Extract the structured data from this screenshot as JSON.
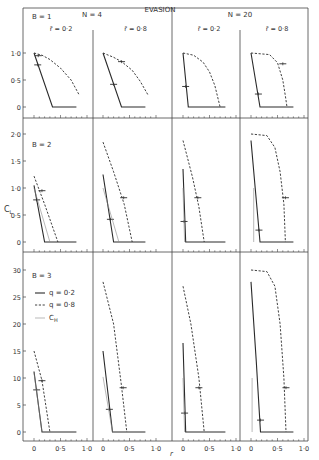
{
  "title": "EVASION",
  "group_labels": [
    {
      "text": "N = 4",
      "x": 92,
      "y": 17
    },
    {
      "text": "N = 20",
      "x": 240,
      "y": 17
    }
  ],
  "column_labels": [
    {
      "text": "r̄ = 0·2",
      "col": 0
    },
    {
      "text": "r̄ = 0·8",
      "col": 1
    },
    {
      "text": "r̄ = 0·2",
      "col": 2
    },
    {
      "text": "r̄ = 0·8",
      "col": 3
    }
  ],
  "row_labels": [
    "B = 1",
    "B = 2",
    "B = 3"
  ],
  "ylabel": "C_L",
  "xlabel": "r",
  "legend": [
    {
      "label": "q = 0·2",
      "style": "solid"
    },
    {
      "label": "q = 0·8",
      "style": "dashed"
    },
    {
      "label": "C_H",
      "style": "thin"
    }
  ],
  "chart_data": {
    "type": "line",
    "title": "EVASION",
    "xlabel": "r",
    "ylabel": "C_L",
    "layout": "small multiples: 3 rows (B = 1, 2, 3) x 4 columns (N = 4: r̄ = 0.2, 0.8; N = 20: r̄ = 0.2, 0.8)",
    "x_ticks": [
      "0",
      "0·5",
      "1·0"
    ],
    "xlim": [
      0,
      1.0
    ],
    "rows": [
      {
        "B": 1,
        "ylim": [
          0,
          1.0
        ],
        "y_ticks": [
          "0",
          "0·5",
          "1·0"
        ]
      },
      {
        "B": 2,
        "ylim": [
          0,
          2.0
        ],
        "y_ticks": [
          "0",
          "0·5",
          "1·0",
          "1·5",
          "2·0"
        ]
      },
      {
        "B": 3,
        "ylim": [
          0,
          3.0
        ],
        "y_ticks": [
          "0",
          "5",
          "10",
          "15",
          "20",
          "25",
          "30"
        ],
        "note": "tick labels read 5..30 meaning 0.5..3.0"
      }
    ],
    "legend": [
      "q = 0·2 (solid)",
      "q = 0·8 (dashed)",
      "C_H (thin solid)"
    ],
    "panels": [
      {
        "B": 1,
        "N": 4,
        "rbar": 0.2,
        "series": [
          {
            "name": "q = 0·2",
            "x": [
              0,
              0.35,
              0.8
            ],
            "y": [
              1.0,
              0,
              0
            ],
            "marker": [
              0.07,
              0.78
            ]
          },
          {
            "name": "q = 0·8",
            "x": [
              0,
              0.15,
              0.3,
              0.5,
              0.7,
              0.85
            ],
            "y": [
              1.0,
              0.96,
              0.88,
              0.72,
              0.5,
              0.23
            ],
            "marker": [
              0.08,
              0.95
            ]
          }
        ]
      },
      {
        "B": 1,
        "N": 4,
        "rbar": 0.8,
        "series": [
          {
            "name": "q = 0·2",
            "x": [
              0,
              0.35,
              0.8
            ],
            "y": [
              1.0,
              0,
              0
            ],
            "marker": [
              0.2,
              0.42
            ]
          },
          {
            "name": "q = 0·8",
            "x": [
              0,
              0.2,
              0.35,
              0.55,
              0.7,
              0.85
            ],
            "y": [
              1.0,
              0.92,
              0.84,
              0.68,
              0.48,
              0.22
            ],
            "marker": [
              0.35,
              0.84
            ]
          }
        ]
      },
      {
        "B": 1,
        "N": 20,
        "rbar": 0.2,
        "series": [
          {
            "name": "q = 0·2",
            "x": [
              0,
              0.1,
              0.8
            ],
            "y": [
              1.0,
              0,
              0
            ],
            "marker": [
              0.05,
              0.38
            ]
          },
          {
            "name": "q = 0·8",
            "x": [
              0,
              0.2,
              0.38,
              0.5,
              0.6,
              0.7
            ],
            "y": [
              1.0,
              0.96,
              0.83,
              0.65,
              0.4,
              0
            ]
          }
        ]
      },
      {
        "B": 1,
        "N": 20,
        "rbar": 0.8,
        "series": [
          {
            "name": "q = 0·2",
            "x": [
              0,
              0.17,
              0.8
            ],
            "y": [
              1.0,
              0,
              0
            ],
            "marker": [
              0.14,
              0.24
            ]
          },
          {
            "name": "q = 0·8",
            "x": [
              0,
              0.35,
              0.5,
              0.6,
              0.65,
              0.68
            ],
            "y": [
              1.0,
              0.97,
              0.82,
              0.5,
              0.2,
              0
            ],
            "marker": [
              0.6,
              0.8
            ]
          }
        ]
      },
      {
        "B": 2,
        "N": 4,
        "rbar": 0.2,
        "series": [
          {
            "name": "q = 0·2",
            "x": [
              0,
              0.2,
              0.8
            ],
            "y": [
              1.05,
              0,
              0
            ],
            "marker": [
              0.05,
              0.78
            ]
          },
          {
            "name": "q = 0·8",
            "x": [
              0,
              0.2,
              0.45
            ],
            "y": [
              1.22,
              0.7,
              0
            ],
            "marker": [
              0.15,
              0.95
            ]
          },
          {
            "name": "C_H",
            "x": [
              0,
              0.3
            ],
            "y": [
              1.0,
              0
            ]
          }
        ]
      },
      {
        "B": 2,
        "N": 4,
        "rbar": 0.8,
        "series": [
          {
            "name": "q = 0·2",
            "x": [
              0,
              0.2,
              0.8
            ],
            "y": [
              1.25,
              0,
              0
            ],
            "marker": [
              0.14,
              0.42
            ]
          },
          {
            "name": "q = 0·8",
            "x": [
              0,
              0.2,
              0.4,
              0.55
            ],
            "y": [
              1.85,
              1.3,
              0.7,
              0
            ],
            "marker": [
              0.39,
              0.82
            ]
          },
          {
            "name": "C_H",
            "x": [
              0,
              0.3
            ],
            "y": [
              1.0,
              0
            ]
          }
        ]
      },
      {
        "B": 2,
        "N": 20,
        "rbar": 0.2,
        "series": [
          {
            "name": "q = 0·2",
            "x": [
              0,
              0.05,
              0.8
            ],
            "y": [
              1.35,
              0,
              0
            ],
            "marker": [
              0.02,
              0.38
            ]
          },
          {
            "name": "q = 0·8",
            "x": [
              0,
              0.18,
              0.3,
              0.4
            ],
            "y": [
              1.88,
              1.2,
              0.65,
              0
            ],
            "marker": [
              0.28,
              0.82
            ]
          },
          {
            "name": "C_H",
            "x": [
              0,
              0.03
            ],
            "y": [
              1.0,
              0
            ]
          }
        ]
      },
      {
        "B": 2,
        "N": 20,
        "rbar": 0.8,
        "series": [
          {
            "name": "q = 0·2",
            "x": [
              0,
              0.08,
              0.17,
              0.8
            ],
            "y": [
              1.88,
              1.0,
              0,
              0
            ],
            "marker": [
              0.15,
              0.22
            ]
          },
          {
            "name": "q = 0·8",
            "x": [
              0,
              0.3,
              0.45,
              0.55,
              0.62,
              0.65
            ],
            "y": [
              2.0,
              1.97,
              1.75,
              1.3,
              0.7,
              0
            ],
            "marker": [
              0.65,
              0.82
            ]
          },
          {
            "name": "C_H",
            "x": [
              0.05,
              0.05
            ],
            "y": [
              1.0,
              0
            ]
          }
        ]
      },
      {
        "B": 3,
        "N": 4,
        "rbar": 0.2,
        "series": [
          {
            "name": "q = 0·2",
            "x": [
              0,
              0.15,
              0.8
            ],
            "y": [
              1.12,
              0,
              0
            ],
            "marker": [
              0.05,
              0.78
            ]
          },
          {
            "name": "q = 0·8",
            "x": [
              0,
              0.15,
              0.3
            ],
            "y": [
              1.5,
              0.95,
              0
            ],
            "marker": [
              0.15,
              0.95
            ]
          },
          {
            "name": "C_H",
            "x": [
              0,
              0.15
            ],
            "y": [
              1.1,
              0
            ]
          }
        ]
      },
      {
        "B": 3,
        "N": 4,
        "rbar": 0.8,
        "series": [
          {
            "name": "q = 0·2",
            "x": [
              0,
              0.18,
              0.8
            ],
            "y": [
              1.5,
              0,
              0
            ],
            "marker": [
              0.12,
              0.42
            ]
          },
          {
            "name": "q = 0·8",
            "x": [
              0,
              0.2,
              0.35,
              0.45
            ],
            "y": [
              2.78,
              2.0,
              0.85,
              0
            ],
            "marker": [
              0.38,
              0.82
            ]
          },
          {
            "name": "C_H",
            "x": [
              0,
              0.18
            ],
            "y": [
              1.02,
              0
            ]
          }
        ]
      },
      {
        "B": 3,
        "N": 20,
        "rbar": 0.2,
        "series": [
          {
            "name": "q = 0·2",
            "x": [
              0,
              0.05,
              0.8
            ],
            "y": [
              1.65,
              0,
              0
            ],
            "marker": [
              0.03,
              0.35
            ]
          },
          {
            "name": "q = 0·8",
            "x": [
              0,
              0.15,
              0.3,
              0.4
            ],
            "y": [
              2.7,
              2.0,
              1.0,
              0
            ],
            "marker": [
              0.3,
              0.82
            ]
          },
          {
            "name": "C_H",
            "x": [
              0,
              0.03
            ],
            "y": [
              1.0,
              0
            ]
          }
        ]
      },
      {
        "B": 3,
        "N": 20,
        "rbar": 0.8,
        "series": [
          {
            "name": "q = 0·2",
            "x": [
              0,
              0.1,
              0.18,
              0.8
            ],
            "y": [
              2.78,
              1.3,
              0,
              0
            ],
            "marker": [
              0.18,
              0.22
            ]
          },
          {
            "name": "q = 0·8",
            "x": [
              0,
              0.3,
              0.45,
              0.55,
              0.62,
              0.66
            ],
            "y": [
              3.0,
              2.97,
              2.7,
              2.0,
              1.0,
              0
            ],
            "marker": [
              0.66,
              0.82
            ]
          },
          {
            "name": "C_H",
            "x": [
              0.02,
              0.02
            ],
            "y": [
              1.0,
              0
            ]
          }
        ]
      }
    ]
  },
  "layout": {
    "frame": {
      "left": 23,
      "top": 8,
      "right": 308
    },
    "col_zero_x": [
      34,
      103,
      183,
      251
    ],
    "col_dividers": [
      93,
      172,
      240
    ],
    "x_unit_px": 53,
    "rows": [
      {
        "zero_y": 107,
        "unit_px": 54,
        "axis_y": 118,
        "top_y": 8,
        "label_x": 32,
        "label_y": 19
      },
      {
        "zero_y": 242,
        "unit_px": 54,
        "axis_y": 252,
        "top_y": 118,
        "label_x": 32,
        "label_y": 147
      },
      {
        "zero_y": 432,
        "unit_px": 54,
        "axis_y": 441,
        "top_y": 252,
        "label_x": 32,
        "label_y": 278
      }
    ],
    "colors": {
      "ink": "#2a2a2a",
      "thin": "#8a8a8a",
      "frame": "#444444"
    }
  }
}
